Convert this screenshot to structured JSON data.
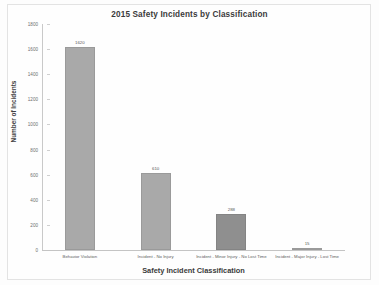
{
  "chart_data": {
    "type": "bar",
    "title": "2015 Safety Incidents by Classification",
    "xlabel": "Safety Incident Classification",
    "ylabel": "Number of Incidents",
    "categories": [
      "Behavior Violation",
      "Incident - No Injury",
      "Incident - Minor Injury - No Lost Time",
      "Incident - Major Injury - Lost Time"
    ],
    "values": [
      1620,
      610,
      288,
      15
    ],
    "value_labels": [
      "1620",
      "610",
      "288",
      "15"
    ],
    "ylim": [
      0,
      1800
    ],
    "ytick_labels": [
      "1800",
      "1600",
      "1400",
      "1200",
      "1000",
      "800",
      "600",
      "400",
      "200",
      "0"
    ],
    "ytick_values": [
      1800,
      1600,
      1400,
      1200,
      1000,
      800,
      600,
      400,
      200,
      0
    ],
    "grid": false,
    "legend": false,
    "bar_color": "#a9a9a9",
    "bar_color_alt": "#8f8f8f",
    "background": "#fefefe"
  }
}
